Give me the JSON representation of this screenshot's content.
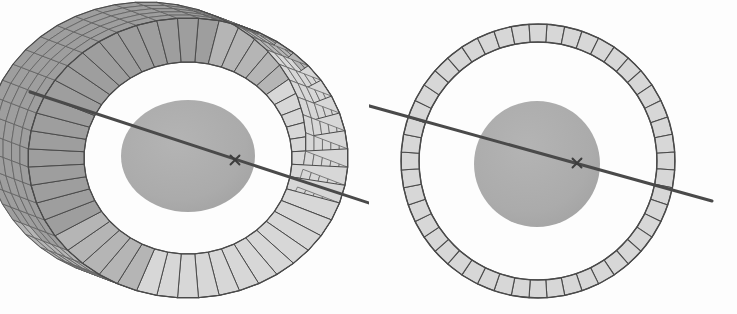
{
  "figure": {
    "title": "Segmented annular ring with central disc and tilted axis",
    "background_color": "#fdfdfd",
    "panel_count": 2,
    "caption": ""
  },
  "colors": {
    "background": "#fdfdfd",
    "segment_fill": "#d7d7d7",
    "segment_fill_shaded": "#b5b5b5",
    "segment_fill_dark": "#9e9e9e",
    "outline": "#4a4a4a",
    "mesh_line": "#5c5c5c",
    "disc_fill": "#ababab",
    "axis_line": "#4a4a4a",
    "cross_mark": "#3d3d3d",
    "inner_void": "#fefefe"
  },
  "panels": [
    {
      "id": "left-perspective-view",
      "name": "perspective-torus-view",
      "description": "Three-dimensional perspective rendering of a segmented cylindrical ring wrapped with a quadrilateral mesh, enclosing a shaded elliptical disc pierced by a tilted axis.",
      "center": {
        "x": 188,
        "y": 158
      },
      "ring": {
        "shape": "torus-perspective",
        "outer_radius_x": 160,
        "outer_radius_y": 140,
        "inner_radius_x": 104,
        "inner_radius_y": 96,
        "segment_count": 48,
        "mesh_rows": 5,
        "depth_offset_x": 42,
        "depth_offset_y": 16,
        "tilt_degrees": 22
      },
      "disc": {
        "shape": "ellipse",
        "center_x": 188,
        "center_y": 156,
        "radius_x": 67,
        "radius_y": 56,
        "label": "shaded-core-disc"
      },
      "axis": {
        "start_x": 30,
        "start_y": 92,
        "end_x": 375,
        "end_y": 205,
        "width": 3,
        "label": "rotation-axis"
      },
      "cross_mark": {
        "x": 235,
        "y": 160,
        "size": 9,
        "label": "axis-center-marker"
      }
    },
    {
      "id": "right-face-on-view",
      "name": "face-on-annulus-view",
      "description": "Face-on orthographic view of the same segmented annulus showing a flat ring of trapezoidal tiles surrounding a shaded circular disc crossed by the tilted axis.",
      "center": {
        "x": 538,
        "y": 161
      },
      "ring": {
        "shape": "annulus",
        "outer_radius": 137,
        "inner_radius": 119,
        "segment_count": 48,
        "mesh_rows": 1,
        "tilt_degrees": 0
      },
      "disc": {
        "shape": "circle",
        "center_x": 537,
        "center_y": 164,
        "radius": 63,
        "label": "shaded-core-disc"
      },
      "axis": {
        "start_x": 366,
        "start_y": 105,
        "end_x": 712,
        "end_y": 201,
        "width": 3,
        "label": "rotation-axis"
      },
      "cross_mark": {
        "x": 577,
        "y": 163,
        "size": 9,
        "label": "axis-center-marker"
      }
    }
  ],
  "legend": {
    "visible": false,
    "entries": []
  },
  "annotations": {
    "visible_text": [],
    "axis_labels": [],
    "tick_labels": []
  }
}
